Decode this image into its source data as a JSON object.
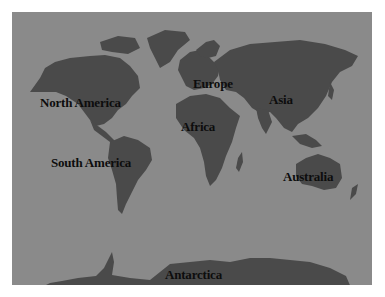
{
  "map": {
    "title": "World Map",
    "colors": {
      "ocean": "#8a8a8a",
      "land": "#4a4a4a",
      "label": "#0d0d0d",
      "border": "#ffffff"
    },
    "labels": [
      {
        "id": "north-america",
        "text": "North America",
        "x": 40,
        "y": 95
      },
      {
        "id": "south-america",
        "text": "South America",
        "x": 51,
        "y": 155
      },
      {
        "id": "europe",
        "text": "Europe",
        "x": 193,
        "y": 76
      },
      {
        "id": "africa",
        "text": "Africa",
        "x": 181,
        "y": 119
      },
      {
        "id": "asia",
        "text": "Asia",
        "x": 269,
        "y": 92
      },
      {
        "id": "australia",
        "text": "Australia",
        "x": 283,
        "y": 169
      },
      {
        "id": "antarctica",
        "text": "Antarctica",
        "x": 165,
        "y": 267
      }
    ]
  }
}
